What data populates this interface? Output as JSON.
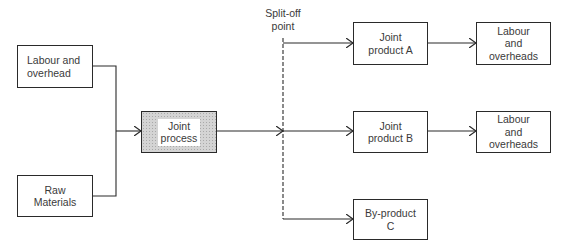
{
  "diagram": {
    "type": "flowchart",
    "title": "",
    "inputs": [
      {
        "id": "labour_overhead",
        "label": "Labour and\noverhead"
      },
      {
        "id": "raw_materials",
        "label": "Raw\nMaterials"
      }
    ],
    "process": {
      "id": "joint_process",
      "label": "Joint\nprocess"
    },
    "split_label": "Split-off\npoint",
    "outputs": [
      {
        "id": "joint_product_a",
        "label": "Joint\nproduct A"
      },
      {
        "id": "joint_product_b",
        "label": "Joint\nproduct B"
      },
      {
        "id": "by_product_c",
        "label": "By-product\nC"
      }
    ],
    "further_costs": [
      {
        "id": "labour_a",
        "label": "Labour\nand\noverheads"
      },
      {
        "id": "labour_b",
        "label": "Labour\nand\noverheads"
      }
    ],
    "edges": [
      [
        "labour_overhead",
        "joint_process"
      ],
      [
        "raw_materials",
        "joint_process"
      ],
      [
        "joint_process",
        "split_off_point"
      ],
      [
        "split_off_point",
        "joint_product_a"
      ],
      [
        "split_off_point",
        "joint_product_b"
      ],
      [
        "split_off_point",
        "by_product_c"
      ],
      [
        "joint_product_a",
        "labour_a"
      ],
      [
        "joint_product_b",
        "labour_b"
      ]
    ],
    "colors": {
      "line": "#2a2a2a",
      "process_fill": "#d4d4d4"
    }
  }
}
